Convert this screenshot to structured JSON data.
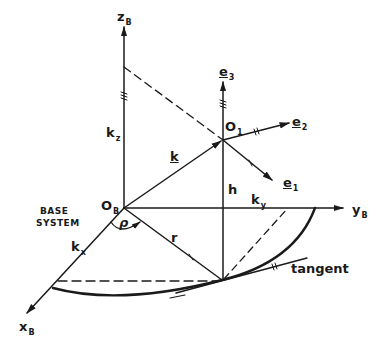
{
  "diagram": {
    "title_block": {
      "line1": "BASE",
      "line2": "SYSTEM"
    },
    "axes": {
      "z": {
        "main": "z",
        "sub": "B"
      },
      "y": {
        "main": "y",
        "sub": "B"
      },
      "x": {
        "main": "x",
        "sub": "B"
      }
    },
    "origins": {
      "base": {
        "main": "O",
        "sub": "B"
      },
      "body": {
        "main": "O",
        "sub": "1"
      }
    },
    "unit_vectors": {
      "e1": {
        "main": "e",
        "sub": "1"
      },
      "e2": {
        "main": "e",
        "sub": "2"
      },
      "e3": {
        "main": "e",
        "sub": "3"
      }
    },
    "quantities": {
      "k": "k",
      "kx": {
        "main": "k",
        "sub": "x"
      },
      "ky": {
        "main": "k",
        "sub": "y"
      },
      "kz": {
        "main": "k",
        "sub": "z"
      },
      "h": "h",
      "r": "r",
      "rho": "ρ"
    },
    "annotations": {
      "tangent": "tangent"
    },
    "colors": {
      "ink": "#1a1a1a",
      "background": "#ffffff"
    }
  }
}
